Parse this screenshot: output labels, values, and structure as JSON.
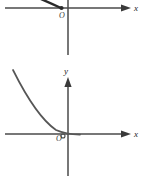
{
  "figure": {
    "background_color": "#ffffff",
    "width": 143,
    "height": 176,
    "panels": [
      {
        "id": "upper-panel",
        "note": "cropped coordinate plane, only region near and above x-axis visible",
        "axis_color": "#4a4a4a",
        "curve_color": "#2a2a2a",
        "x_axis": {
          "label": "x",
          "label_x": 135,
          "label_y": 11,
          "y_position": 8,
          "x_start": 5,
          "x_end": 130,
          "arrow": "right"
        },
        "y_axis": {
          "label": "",
          "x_position": 68,
          "y_start": 0,
          "y_end": 55,
          "arrow": "none"
        },
        "origin_label": "O",
        "origin_label_x": 60,
        "origin_label_y": 18,
        "curve": {
          "type": "decreasing-convex-segment",
          "stroke_width": 2.2,
          "endpoint_dot": true,
          "dot_x": 61,
          "dot_y": 8,
          "points": [
            [
              36,
              -2
            ],
            [
              45,
              2
            ],
            [
              53,
              5
            ],
            [
              61,
              8
            ]
          ]
        }
      },
      {
        "id": "lower-panel",
        "note": "full coordinate plane with decaying convex curve approaching x-axis",
        "axis_color": "#4a4a4a",
        "curve_color": "#565656",
        "x_axis": {
          "label": "x",
          "label_x": 135,
          "label_y": 137,
          "y_position": 134,
          "x_start": 5,
          "x_end": 130,
          "arrow": "right"
        },
        "y_axis": {
          "label": "y",
          "label_x": 65,
          "label_y": 74,
          "x_position": 68,
          "y_start": 78,
          "y_end": 176,
          "arrow": "up"
        },
        "origin_label": "O",
        "origin_label_x": 57,
        "origin_label_y": 142,
        "curve": {
          "type": "decaying-exponential",
          "stroke_width": 1.6,
          "points": [
            [
              13,
              71
            ],
            [
              20,
              84
            ],
            [
              28,
              98
            ],
            [
              36,
              110
            ],
            [
              44,
              120
            ],
            [
              52,
              128
            ],
            [
              60,
              132
            ],
            [
              68,
              134
            ],
            [
              76,
              134.5
            ]
          ]
        }
      }
    ]
  }
}
